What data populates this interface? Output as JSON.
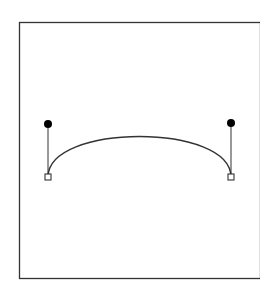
{
  "diagram": {
    "type": "cubic-bezier-curve",
    "frame": {
      "x": 19.5,
      "y": 22.5,
      "width": 241,
      "height": 256,
      "stroke": "#333333"
    },
    "curve": {
      "start_anchor": {
        "x": 48,
        "y": 177
      },
      "control_1": {
        "x": 48,
        "y": 123
      },
      "control_2": {
        "x": 231,
        "y": 123
      },
      "end_anchor": {
        "x": 231,
        "y": 177
      },
      "stroke": "#333333"
    },
    "handles": [
      {
        "name": "left",
        "anchor": {
          "x": 48,
          "y": 177
        },
        "knob": {
          "x": 48,
          "y": 124
        }
      },
      {
        "name": "right",
        "anchor": {
          "x": 231,
          "y": 177
        },
        "knob": {
          "x": 231,
          "y": 123
        }
      }
    ],
    "colors": {
      "line": "#333333",
      "knob_fill": "#000000",
      "anchor_fill": "#ffffff"
    }
  }
}
